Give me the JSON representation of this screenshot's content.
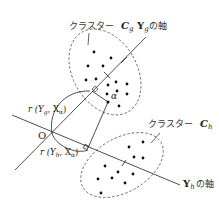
{
  "diagram": {
    "cluster_g": {
      "label_prefix": "クラスター",
      "label_symbol": "C",
      "label_sub": "g"
    },
    "cluster_h": {
      "label_prefix": "クラスター",
      "label_symbol": "C",
      "label_sub": "h"
    },
    "axis_g": {
      "symbol": "Y",
      "sub": "g",
      "suffix": "の軸"
    },
    "axis_h": {
      "symbol": "Y",
      "sub": "h",
      "suffix": "の軸"
    },
    "origin_label": "O",
    "point_label": "α",
    "proj_g_label": {
      "prefix": "r (Y",
      "sub1": "g",
      "mid": ", X",
      "sub2": "α",
      "suffix": ")"
    },
    "proj_h_label": {
      "prefix": "r (Y",
      "sub1": "h",
      "mid": ", X",
      "sub2": "α",
      "suffix": ")"
    }
  }
}
